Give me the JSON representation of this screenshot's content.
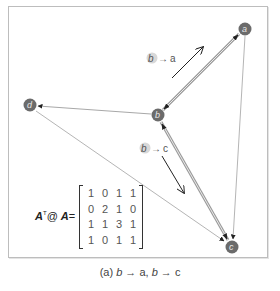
{
  "diagram": {
    "nodes": [
      {
        "id": "a",
        "label": "a",
        "x": 245,
        "y": 29
      },
      {
        "id": "b",
        "label": "b",
        "x": 158,
        "y": 115
      },
      {
        "id": "c",
        "label": "c",
        "x": 232,
        "y": 247
      },
      {
        "id": "d",
        "label": "d",
        "x": 30,
        "y": 105
      }
    ],
    "edges": [
      {
        "from": "b",
        "to": "a",
        "style": "thick",
        "bidirectional": true
      },
      {
        "from": "b",
        "to": "c",
        "style": "thick",
        "bidirectional": true
      },
      {
        "from": "b",
        "to": "d",
        "style": "thin"
      },
      {
        "from": "d",
        "to": "c",
        "style": "thin"
      },
      {
        "from": "a",
        "to": "c",
        "style": "thin"
      }
    ],
    "annotations": [
      {
        "id": "b-to-a",
        "source": "b",
        "arrow": "→",
        "target": "a"
      },
      {
        "id": "b-to-c",
        "source": "b",
        "arrow": "→",
        "target": "c"
      }
    ],
    "colors": {
      "node_fill": "#6b6b6b",
      "thick_edge": "#9a9a9a",
      "thin_edge": "#a8a8a8",
      "frame": "#bdbdbd"
    }
  },
  "matrix": {
    "label_a1": "A",
    "label_sup": "T",
    "label_op": "@",
    "label_a2": "A",
    "label_eq": "=",
    "rows": [
      [
        "1",
        "0",
        "1",
        "1"
      ],
      [
        "0",
        "2",
        "1",
        "0"
      ],
      [
        "1",
        "1",
        "3",
        "1"
      ],
      [
        "1",
        "0",
        "1",
        "1"
      ]
    ],
    "highlighted_cell": [
      2,
      0
    ]
  },
  "caption": {
    "prefix": "(a) ",
    "part1_src": "b",
    "arrow1": " → ",
    "part1_dst": "a",
    "sep": ", ",
    "part2_src": "b",
    "arrow2": " → ",
    "part2_dst": "c"
  }
}
